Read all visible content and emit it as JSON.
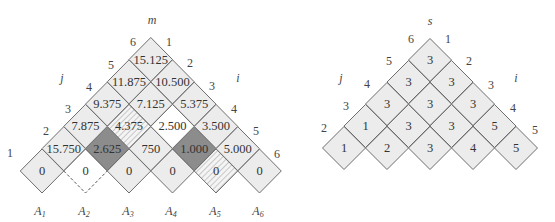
{
  "left_diagram": {
    "top_label": "m",
    "left_axis_label": "j",
    "right_axis_label": "i",
    "left_indices": [
      "1",
      "2",
      "3",
      "4",
      "5",
      "6"
    ],
    "right_indices": [
      "1",
      "2",
      "3",
      "4",
      "5",
      "6"
    ],
    "matrices": [
      "A1",
      "A2",
      "A3",
      "A4",
      "A5",
      "A6"
    ],
    "matrix_labels": [
      {
        "base": "A",
        "sub": "1"
      },
      {
        "base": "A",
        "sub": "2"
      },
      {
        "base": "A",
        "sub": "3"
      },
      {
        "base": "A",
        "sub": "4"
      },
      {
        "base": "A",
        "sub": "5"
      },
      {
        "base": "A",
        "sub": "6"
      }
    ],
    "rows": [
      [
        "0",
        "0",
        "0",
        "0",
        "0",
        "0"
      ],
      [
        "15.750",
        "2.625",
        "750",
        "1.000",
        "5.000"
      ],
      [
        "7.875",
        "4.375",
        "2.500",
        "3.500"
      ],
      [
        "9.375",
        "7.125",
        "5.375"
      ],
      [
        "11.875",
        "10.500"
      ],
      [
        "15.125"
      ]
    ],
    "cell_styles": [
      [
        "light",
        "white-dashed",
        "light",
        "light",
        "hatched",
        "light"
      ],
      [
        "light",
        "dark",
        "light",
        "dark",
        "light"
      ],
      [
        "light",
        "hatched",
        "white",
        "light"
      ],
      [
        "light",
        "light",
        "light"
      ],
      [
        "light",
        "light"
      ],
      [
        "light"
      ]
    ]
  },
  "right_diagram": {
    "top_label": "s",
    "left_axis_label": "j",
    "right_axis_label": "i",
    "left_indices": [
      "2",
      "3",
      "4",
      "5",
      "6"
    ],
    "right_indices": [
      "1",
      "2",
      "3",
      "4",
      "5"
    ],
    "rows": [
      [
        "1",
        "2",
        "3",
        "4",
        "5"
      ],
      [
        "1",
        "3",
        "3",
        "5"
      ],
      [
        "3",
        "3",
        "3"
      ],
      [
        "3",
        "3"
      ],
      [
        "3"
      ]
    ]
  },
  "colors": {
    "light_cell": "#ececec",
    "dark_cell": "#8c8c8c",
    "white_cell": "#ffffff",
    "border": "#6e6e6e"
  }
}
